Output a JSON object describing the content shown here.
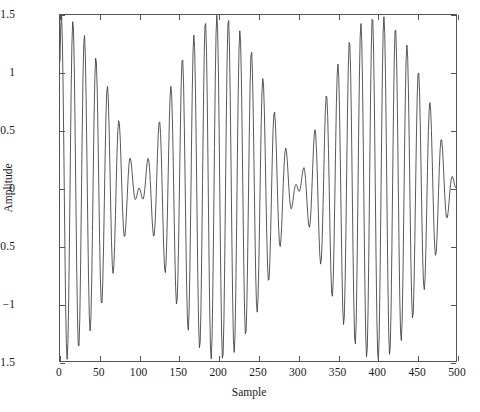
{
  "figure": {
    "axis_line_color": "#555555",
    "curve_color": "#3a3a3a",
    "background": "#ffffff"
  },
  "axes": {
    "x_title": "Sample",
    "y_title": "Amplitude",
    "x_ticks": [
      "0",
      "50",
      "100",
      "150",
      "200",
      "250",
      "300",
      "350",
      "400",
      "450",
      "500"
    ],
    "x_tick_values": [
      0,
      50,
      100,
      150,
      200,
      250,
      300,
      350,
      400,
      450,
      500
    ],
    "y_ticks": [
      "1.5",
      "1",
      "0.5",
      "0",
      "−0.5",
      "−1",
      "−1.5"
    ],
    "y_tick_values": [
      1.5,
      1,
      0.5,
      0,
      -0.5,
      -1,
      -1.5
    ]
  },
  "chart_data": {
    "type": "line",
    "title": "",
    "xlabel": "Sample",
    "ylabel": "Amplitude",
    "xlim": [
      0,
      500
    ],
    "ylim": [
      -1.5,
      1.5
    ],
    "grid": false,
    "legend": null,
    "series": [
      {
        "name": "two-tone beat signal",
        "description": "Sum of two equal-amplitude sinusoids producing an amplitude-modulated beat: envelope maxima of 1.5 near samples 0, 200 and 400; envelope minima near samples 100 and 300. Carrier period about 15.7 samples.",
        "model": {
          "kind": "sum_of_sines",
          "amplitude": 0.75,
          "f1": 0.06625,
          "f2": 0.07125,
          "phase1": 0.82,
          "phase2": 0.82,
          "beat_period_samples": 200,
          "carrier_period_samples": 15.71
        },
        "n_points": 501,
        "x_start": 0,
        "x_end": 500,
        "annotated_points": [
          {
            "x": 0,
            "y": 1.1
          },
          {
            "x": 20,
            "y": 1.49
          },
          {
            "x": 35,
            "y": 1.22
          },
          {
            "x": 52,
            "y": 0.95
          },
          {
            "x": 68,
            "y": 0.76
          },
          {
            "x": 84,
            "y": 0.64
          },
          {
            "x": 100,
            "y": 0.6
          },
          {
            "x": 116,
            "y": 0.67
          },
          {
            "x": 132,
            "y": 0.82
          },
          {
            "x": 148,
            "y": 1.02
          },
          {
            "x": 164,
            "y": 1.22
          },
          {
            "x": 180,
            "y": 1.4
          },
          {
            "x": 200,
            "y": 1.5
          },
          {
            "x": 216,
            "y": 1.42
          },
          {
            "x": 232,
            "y": 1.25
          },
          {
            "x": 248,
            "y": 1.04
          },
          {
            "x": 264,
            "y": 0.84
          },
          {
            "x": 280,
            "y": 0.68
          },
          {
            "x": 300,
            "y": 0.6
          },
          {
            "x": 316,
            "y": 0.66
          },
          {
            "x": 332,
            "y": 0.8
          },
          {
            "x": 348,
            "y": 1.0
          },
          {
            "x": 364,
            "y": 1.2
          },
          {
            "x": 380,
            "y": 1.38
          },
          {
            "x": 400,
            "y": 1.5
          },
          {
            "x": 416,
            "y": 1.4
          },
          {
            "x": 432,
            "y": 1.22
          },
          {
            "x": 448,
            "y": 1.02
          },
          {
            "x": 464,
            "y": 0.82
          },
          {
            "x": 480,
            "y": 0.68
          },
          {
            "x": 500,
            "y": 0.15
          }
        ]
      }
    ]
  }
}
